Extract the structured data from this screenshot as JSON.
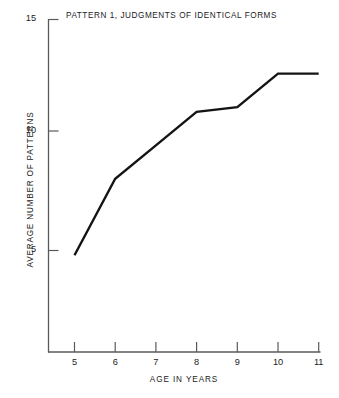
{
  "chart_data": {
    "type": "line",
    "title": "PATTERN 1, JUDGMENTS OF IDENTICAL FORMS",
    "xlabel": "AGE IN YEARS",
    "ylabel": "AVERAGE NUMBER OF PATTERNS",
    "x": [
      5,
      6,
      7,
      8,
      9,
      10,
      11
    ],
    "values": [
      4.8,
      8.0,
      9.4,
      10.8,
      11.0,
      12.4,
      12.4
    ],
    "series": [
      {
        "name": "Average number of patterns",
        "values": [
          4.8,
          8.0,
          9.4,
          10.8,
          11.0,
          12.4,
          12.4
        ]
      }
    ],
    "xlim": [
      4.35,
      11.05
    ],
    "ylim": [
      0,
      15.45
    ],
    "xticks": [
      5,
      6,
      7,
      8,
      9,
      10,
      11
    ],
    "xtick_labels": [
      "5",
      "6",
      "7",
      "8",
      "9",
      "10",
      "11"
    ],
    "yticks": [
      5,
      10,
      15
    ],
    "ytick_labels": [
      "5",
      "10",
      "15"
    ],
    "grid": false,
    "legend": false,
    "line_color": "#141414",
    "axis_color": "#555555",
    "background": "#ffffff"
  }
}
